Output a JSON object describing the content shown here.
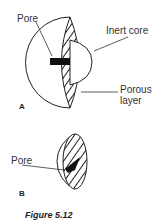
{
  "figure": {
    "caption": "Figure 5.12",
    "panel_a": {
      "tag": "A",
      "labels": {
        "pore": "Pore",
        "inert_core": "Inert core",
        "porous_layer_line1": "Porous",
        "porous_layer_line2": "layer"
      }
    },
    "panel_b": {
      "tag": "B",
      "labels": {
        "pore": "Pore"
      }
    }
  }
}
